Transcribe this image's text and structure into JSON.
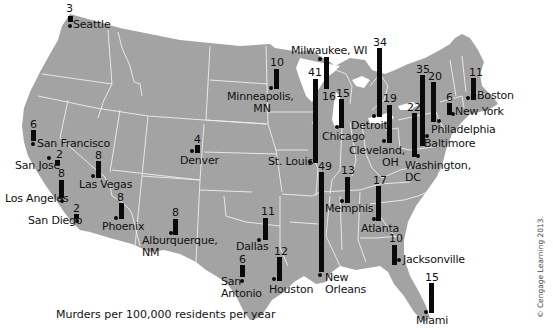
{
  "chart_data": {
    "type": "bar",
    "subtype": "map-bars",
    "title": "",
    "caption": "Murders per 100,000 residents per year",
    "credit": "© Cengage Learning 2013.",
    "categories": [
      "Seattle",
      "San Francisco",
      "San Jose",
      "Los Angeles",
      "San Diego",
      "Las Vegas",
      "Phoenix",
      "Alburquerque, NM",
      "Denver",
      "Minneapolis, MN",
      "Milwaukee, WI",
      "St. Louis",
      "Chicago",
      "Detroit",
      "Cleveland, OH",
      "Washington, DC",
      "Baltimore",
      "Philadelphia",
      "New York",
      "Boston",
      "Dallas",
      "San Antonio",
      "Houston",
      "New Orleans",
      "Memphis",
      "Atlanta",
      "Jacksonville",
      "Miami"
    ],
    "values": [
      3,
      6,
      2,
      8,
      2,
      8,
      8,
      8,
      4,
      10,
      16,
      41,
      15,
      34,
      19,
      22,
      35,
      20,
      6,
      11,
      11,
      6,
      12,
      49,
      13,
      17,
      10,
      15
    ],
    "ylabel": "Murders per 100,000 residents per year"
  },
  "cities": [
    {
      "name": "Seattle",
      "value": "3",
      "dot": [
        68,
        24
      ],
      "bar": [
        68,
        16,
        6
      ],
      "val": [
        66,
        3
      ],
      "lbl": [
        73,
        19
      ],
      "label": "Seattle"
    },
    {
      "name": "San Francisco",
      "value": "6",
      "dot": [
        31,
        142
      ],
      "bar": [
        31,
        130,
        11
      ],
      "val": [
        30,
        119
      ],
      "lbl": [
        37,
        138
      ],
      "label": "San Francisco"
    },
    {
      "name": "San Jose",
      "value": "2",
      "dot": [
        47,
        156
      ],
      "bar": [
        55,
        160,
        5
      ],
      "val": [
        56,
        149
      ],
      "lbl": [
        15,
        160
      ],
      "label": "San Jose"
    },
    {
      "name": "Los Angeles",
      "value": "8",
      "dot": [
        60,
        199
      ],
      "bar": [
        59,
        180,
        18
      ],
      "val": [
        58,
        168
      ],
      "lbl": [
        5,
        193
      ],
      "label": "Los Angeles"
    },
    {
      "name": "San Diego",
      "value": "2",
      "dot": [
        75,
        219
      ],
      "bar": [
        74,
        214,
        5
      ],
      "val": [
        73,
        203
      ],
      "lbl": [
        28,
        215
      ],
      "label": "San Diego"
    },
    {
      "name": "Las Vegas",
      "value": "8",
      "dot": [
        91,
        174
      ],
      "bar": [
        96,
        161,
        17
      ],
      "val": [
        95,
        150
      ],
      "lbl": [
        79,
        179
      ],
      "label": "Las Vegas"
    },
    {
      "name": "Phoenix",
      "value": "8",
      "dot": [
        114,
        216
      ],
      "bar": [
        119,
        203,
        16
      ],
      "val": [
        117,
        192
      ],
      "lbl": [
        102,
        221
      ],
      "label": "Phoenix"
    },
    {
      "name": "Alburquerque, NM",
      "value": "8",
      "dot": [
        169,
        231
      ],
      "bar": [
        173,
        219,
        16
      ],
      "val": [
        172,
        207
      ],
      "lbl": [
        142,
        235
      ],
      "label": "Alburquerque,\nNM"
    },
    {
      "name": "Denver",
      "value": "4",
      "dot": [
        190,
        149
      ],
      "bar": [
        195,
        145,
        8
      ],
      "val": [
        194,
        134
      ],
      "lbl": [
        180,
        155
      ],
      "label": "Denver"
    },
    {
      "name": "Minneapolis, MN",
      "value": "10",
      "dot": [
        269,
        86
      ],
      "bar": [
        274,
        69,
        20
      ],
      "val": [
        270,
        57
      ],
      "lbl": [
        227,
        91
      ],
      "label": "Minneapolis,\n        MN"
    },
    {
      "name": "Milwaukee, WI",
      "value": "16",
      "dot": [
        318,
        57
      ],
      "bar": [
        324,
        57,
        32
      ],
      "val": [
        322,
        91
      ],
      "lbl": [
        291,
        45
      ],
      "label": "Milwaukee, WI"
    },
    {
      "name": "St. Louis",
      "value": "41",
      "dot": [
        308,
        160
      ],
      "bar": [
        313,
        79,
        84
      ],
      "val": [
        308,
        67
      ],
      "lbl": [
        268,
        156
      ],
      "label": "St. Louis"
    },
    {
      "name": "Chicago",
      "value": "15",
      "dot": [
        335,
        125
      ],
      "bar": [
        339,
        99,
        29
      ],
      "val": [
        336,
        88
      ],
      "lbl": [
        322,
        131
      ],
      "label": "Chicago"
    },
    {
      "name": "Detroit",
      "value": "34",
      "dot": [
        372,
        114
      ],
      "bar": [
        377,
        48,
        69
      ],
      "val": [
        373,
        37
      ],
      "lbl": [
        351,
        120
      ],
      "label": "Detroit"
    },
    {
      "name": "Cleveland, OH",
      "value": "19",
      "dot": [
        382,
        139
      ],
      "bar": [
        387,
        105,
        38
      ],
      "val": [
        383,
        93
      ],
      "lbl": [
        349,
        145
      ],
      "label": "Cleveland,\n          OH"
    },
    {
      "name": "Washington, DC",
      "value": "22",
      "dot": [
        416,
        154
      ],
      "bar": [
        412,
        113,
        44
      ],
      "val": [
        407,
        102
      ],
      "lbl": [
        405,
        160
      ],
      "label": "Washington,\nDC"
    },
    {
      "name": "Baltimore",
      "value": "35",
      "dot": [
        425,
        134
      ],
      "bar": [
        420,
        75,
        71
      ],
      "val": [
        416,
        64
      ],
      "lbl": [
        424,
        138
      ],
      "label": "Baltimore"
    },
    {
      "name": "Philadelphia",
      "value": "20",
      "dot": [
        437,
        119
      ],
      "bar": [
        431,
        82,
        40
      ],
      "val": [
        428,
        71
      ],
      "lbl": [
        431,
        124
      ],
      "label": "Philadelphia"
    },
    {
      "name": "New York",
      "value": "6",
      "dot": [
        451,
        112
      ],
      "bar": [
        447,
        103,
        12
      ],
      "val": [
        446,
        92
      ],
      "lbl": [
        455,
        106
      ],
      "label": "New York"
    },
    {
      "name": "Boston",
      "value": "11",
      "dot": [
        466,
        96
      ],
      "bar": [
        471,
        78,
        22
      ],
      "val": [
        469,
        67
      ],
      "lbl": [
        477,
        90
      ],
      "label": "Boston"
    },
    {
      "name": "Dallas",
      "value": "11",
      "dot": [
        257,
        238
      ],
      "bar": [
        263,
        218,
        22
      ],
      "val": [
        261,
        206
      ],
      "lbl": [
        236,
        241
      ],
      "label": "Dallas"
    },
    {
      "name": "San Antonio",
      "value": "6",
      "dot": [
        240,
        279
      ],
      "bar": [
        240,
        265,
        12
      ],
      "val": [
        239,
        254
      ],
      "lbl": [
        221,
        276
      ],
      "label": "San\nAntonio"
    },
    {
      "name": "Houston",
      "value": "12",
      "dot": [
        272,
        277
      ],
      "bar": [
        277,
        257,
        24
      ],
      "val": [
        274,
        246
      ],
      "lbl": [
        269,
        284
      ],
      "label": "Houston"
    },
    {
      "name": "New Orleans",
      "value": "49",
      "dot": [
        318,
        273
      ],
      "bar": [
        319,
        172,
        100
      ],
      "val": [
        318,
        161
      ],
      "lbl": [
        325,
        272
      ],
      "label": "New\nOrleans"
    },
    {
      "name": "Memphis",
      "value": "13",
      "dot": [
        340,
        199
      ],
      "bar": [
        345,
        177,
        26
      ],
      "val": [
        341,
        165
      ],
      "lbl": [
        325,
        203
      ],
      "label": "Memphis"
    },
    {
      "name": "Atlanta",
      "value": "17",
      "dot": [
        372,
        217
      ],
      "bar": [
        376,
        186,
        35
      ],
      "val": [
        373,
        175
      ],
      "lbl": [
        361,
        223
      ],
      "label": "Atlanta"
    },
    {
      "name": "Jacksonville",
      "value": "10",
      "dot": [
        397,
        258
      ],
      "bar": [
        392,
        245,
        20
      ],
      "val": [
        389,
        233
      ],
      "lbl": [
        403,
        254
      ],
      "label": "Jacksonville"
    },
    {
      "name": "Miami",
      "value": "15",
      "dot": [
        424,
        310
      ],
      "bar": [
        429,
        283,
        30
      ],
      "val": [
        425,
        272
      ],
      "lbl": [
        416,
        315
      ],
      "label": "Miami"
    }
  ],
  "caption": "Murders per 100,000 residents per year",
  "credit": "© Cengage Learning 2013.",
  "colors": {
    "land": "#9e9e9e",
    "borders": "#ffffff",
    "bars": "#0a0a0a",
    "background": "#ffffff"
  }
}
